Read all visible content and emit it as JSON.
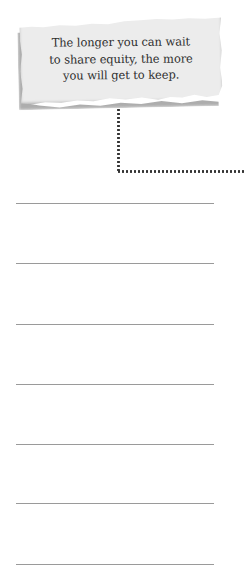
{
  "note": {
    "lines": [
      "The longer you can wait",
      "to share equity, the more",
      "you will get to keep."
    ],
    "background_color": "#ececec",
    "text_color": "#2e2e2e"
  },
  "connector": {
    "style": "dotted",
    "color": "#333333"
  },
  "writing_lines": {
    "count": 7,
    "positions_y": [
      203,
      263,
      324,
      384,
      444,
      503,
      564
    ],
    "values": [
      "",
      "",
      "",
      "",
      "",
      "",
      ""
    ]
  }
}
